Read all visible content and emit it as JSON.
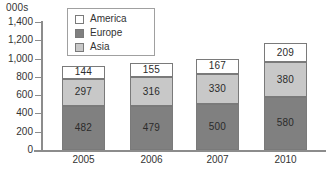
{
  "units_label": "000s",
  "legend": {
    "position": "top-center-inside",
    "items": [
      {
        "label": "America",
        "color": "#ffffff"
      },
      {
        "label": "Europe",
        "color": "#808080"
      },
      {
        "label": "Asia",
        "color": "#c8c8c8"
      }
    ]
  },
  "axis": {
    "y_ticks": [
      "1,400",
      "1,200",
      "1,000",
      "800",
      "600",
      "400",
      "200",
      "0"
    ],
    "y_tick_values": [
      1400,
      1200,
      1000,
      800,
      600,
      400,
      200,
      0
    ]
  },
  "chart_data": {
    "type": "bar",
    "stacked": true,
    "title": "",
    "subtitle": "",
    "xlabel": "",
    "ylabel": "000s",
    "ylim": [
      0,
      1400
    ],
    "ytick_step": 200,
    "grid": false,
    "legend_position": "top-center-inside",
    "categories": [
      "2005",
      "2006",
      "2007",
      "2010"
    ],
    "series": [
      {
        "name": "Asia",
        "color": "#808080",
        "values": [
          482,
          479,
          500,
          580
        ]
      },
      {
        "name": "Europe",
        "color": "#c8c8c8",
        "values": [
          297,
          316,
          330,
          380
        ]
      },
      {
        "name": "America",
        "color": "#ffffff",
        "values": [
          144,
          155,
          167,
          209
        ]
      }
    ],
    "stack_order_bottom_to_top": [
      "Asia",
      "Europe",
      "America"
    ],
    "totals": [
      923,
      950,
      997,
      1169
    ],
    "data_labels": {
      "2005": {
        "Asia": "482",
        "Europe": "297",
        "America": "144"
      },
      "2006": {
        "Asia": "479",
        "Europe": "316",
        "America": "155"
      },
      "2007": {
        "Asia": "500",
        "Europe": "330",
        "America": "167"
      },
      "2010": {
        "Asia": "580",
        "Europe": "380",
        "America": "209"
      }
    }
  }
}
